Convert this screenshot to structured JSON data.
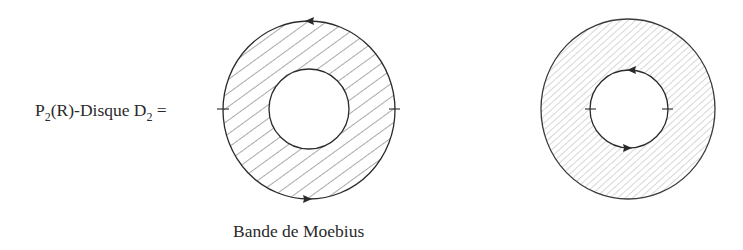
{
  "figure": {
    "left_label": {
      "prefix": "P",
      "prefix_sub": "2",
      "middle": "(R)-Disque D",
      "middle_sub": "2",
      "suffix": " ="
    },
    "caption": "Bande de Moebius",
    "left_diagram": {
      "name": "moebius-band",
      "outer_boundary_orientation": "arrow on top pointing left, arrow on bottom pointing right",
      "identification_marks": 2,
      "hatching": "coarse"
    },
    "right_diagram": {
      "name": "annulus-disk",
      "inner_boundary_orientation": "arrow on top pointing left, arrow on bottom pointing right",
      "identification_marks": 2,
      "hatching": "fine"
    },
    "colors": {
      "ink": "#2a2a2a",
      "hatch_coarse": "#555555",
      "hatch_fine": "#9a9a9a",
      "background": "#ffffff"
    }
  }
}
